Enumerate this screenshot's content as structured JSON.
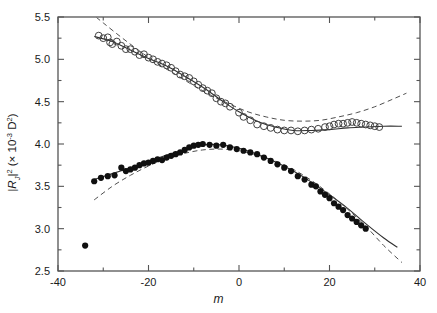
{
  "chart_data": {
    "type": "scatter",
    "title": "",
    "xlabel": "m",
    "ylabel_text": "|RJ|2 (x 10-3 D2)",
    "xlim": [
      -40,
      40
    ],
    "ylim": [
      2.5,
      5.5
    ],
    "xticks": [
      -40,
      -20,
      0,
      20,
      40
    ],
    "xtick_labels": [
      "-40",
      "-20",
      "0",
      "20",
      "40"
    ],
    "xminor_step": 10,
    "yticks": [
      2.5,
      3.0,
      3.5,
      4.0,
      4.5,
      5.0,
      5.5
    ],
    "ytick_labels": [
      "2.5",
      "3.0",
      "3.5",
      "4.0",
      "4.5",
      "5.0",
      "5.5"
    ],
    "yminor_step": 0.25,
    "grid": false,
    "legend": "none",
    "frame": "box",
    "colors": {
      "open_marker_stroke": "#404040",
      "filled_marker": "#101010",
      "fit_solid": "#303030",
      "fit_dashed": "#505050",
      "axis": "#555555",
      "background": "#ffffff"
    },
    "series": [
      {
        "name": "open-circles",
        "marker": "open-circle",
        "x": [
          -31.0,
          -30.0,
          -29.0,
          -28.5,
          -28.0,
          -27.0,
          -26.0,
          -25.0,
          -24.0,
          -23.0,
          -22.0,
          -21.0,
          -20.0,
          -19.0,
          -18.0,
          -17.0,
          -16.0,
          -15.0,
          -14.0,
          -13.0,
          -12.0,
          -11.0,
          -10.0,
          -9.0,
          -8.0,
          -7.0,
          -6.0,
          -5.0,
          -4.0,
          -3.0,
          -2.0,
          0.0,
          1.0,
          2.5,
          4.0,
          5.5,
          7.0,
          8.5,
          10.0,
          11.5,
          13.0,
          14.5,
          16.0,
          17.5,
          19.0,
          20.0,
          21.0,
          22.0,
          23.0,
          24.0,
          25.0,
          26.0,
          27.0,
          28.0,
          29.0,
          30.0,
          31.0
        ],
        "y": [
          5.28,
          5.25,
          5.26,
          5.2,
          5.18,
          5.21,
          5.16,
          5.12,
          5.12,
          5.09,
          5.05,
          5.06,
          5.02,
          5.0,
          4.97,
          4.95,
          4.93,
          4.9,
          4.86,
          4.82,
          4.8,
          4.78,
          4.74,
          4.7,
          4.66,
          4.63,
          4.6,
          4.54,
          4.5,
          4.48,
          4.44,
          4.37,
          4.32,
          4.28,
          4.23,
          4.21,
          4.19,
          4.17,
          4.16,
          4.16,
          4.15,
          4.16,
          4.17,
          4.18,
          4.2,
          4.21,
          4.23,
          4.24,
          4.24,
          4.25,
          4.26,
          4.25,
          4.24,
          4.23,
          4.22,
          4.21,
          4.2
        ]
      },
      {
        "name": "filled-circles",
        "marker": "filled-circle",
        "x": [
          -34.0,
          -32.0,
          -30.5,
          -29.0,
          -27.5,
          -26.0,
          -25.0,
          -24.0,
          -23.0,
          -22.0,
          -21.0,
          -20.0,
          -19.0,
          -18.0,
          -17.0,
          -16.0,
          -15.0,
          -14.0,
          -13.0,
          -12.0,
          -11.0,
          -10.0,
          -9.0,
          -8.0,
          -6.5,
          -5.0,
          -3.5,
          -2.0,
          -0.5,
          1.0,
          2.5,
          4.0,
          5.5,
          7.0,
          8.5,
          10.0,
          11.5,
          13.0,
          14.5,
          16.0,
          17.0,
          18.0,
          19.0,
          20.0,
          21.0,
          22.0,
          23.0,
          24.0,
          25.0,
          26.0,
          27.0,
          28.0
        ],
        "y": [
          2.8,
          3.56,
          3.6,
          3.62,
          3.63,
          3.72,
          3.68,
          3.7,
          3.72,
          3.75,
          3.77,
          3.78,
          3.8,
          3.82,
          3.81,
          3.84,
          3.86,
          3.88,
          3.9,
          3.93,
          3.96,
          3.98,
          3.99,
          4.0,
          3.99,
          3.98,
          3.99,
          3.96,
          3.94,
          3.92,
          3.9,
          3.88,
          3.84,
          3.8,
          3.76,
          3.72,
          3.68,
          3.62,
          3.58,
          3.52,
          3.5,
          3.44,
          3.4,
          3.36,
          3.3,
          3.26,
          3.22,
          3.16,
          3.12,
          3.08,
          3.04,
          3.0
        ]
      }
    ],
    "fits": [
      {
        "name": "open-solid-fit",
        "style": "solid",
        "x": [
          -32,
          -28,
          -24,
          -20,
          -16,
          -12,
          -8,
          -4,
          0,
          4,
          8,
          12,
          16,
          20,
          24,
          28,
          32,
          36
        ],
        "y": [
          5.27,
          5.21,
          5.11,
          5.01,
          4.92,
          4.8,
          4.67,
          4.52,
          4.38,
          4.27,
          4.2,
          4.16,
          4.16,
          4.17,
          4.19,
          4.2,
          4.21,
          4.21
        ]
      },
      {
        "name": "open-dashed-fit",
        "style": "dashed",
        "x": [
          -33,
          -30,
          -26,
          -22,
          -18,
          -14,
          -10,
          -6,
          -2,
          2,
          6,
          10,
          14,
          18,
          22,
          26,
          30,
          34,
          37
        ],
        "y": [
          5.56,
          5.43,
          5.26,
          5.1,
          4.95,
          4.82,
          4.69,
          4.57,
          4.47,
          4.38,
          4.32,
          4.28,
          4.27,
          4.28,
          4.32,
          4.37,
          4.44,
          4.53,
          4.6
        ]
      },
      {
        "name": "filled-solid-fit",
        "style": "solid",
        "x": [
          -32,
          -28,
          -24,
          -20,
          -16,
          -12,
          -8,
          -4,
          0,
          4,
          8,
          12,
          16,
          20,
          24,
          28,
          32,
          35
        ],
        "y": [
          3.58,
          3.65,
          3.72,
          3.79,
          3.87,
          3.93,
          3.99,
          3.99,
          3.95,
          3.88,
          3.79,
          3.68,
          3.55,
          3.4,
          3.24,
          3.06,
          2.89,
          2.78
        ]
      },
      {
        "name": "filled-dashed-fit",
        "style": "dashed",
        "x": [
          -32,
          -28,
          -24,
          -20,
          -16,
          -12,
          -8,
          -4,
          0,
          4,
          8,
          12,
          16,
          20,
          24,
          28,
          32,
          36
        ],
        "y": [
          3.34,
          3.5,
          3.63,
          3.74,
          3.83,
          3.89,
          3.93,
          3.94,
          3.92,
          3.87,
          3.8,
          3.7,
          3.57,
          3.41,
          3.23,
          3.03,
          2.8,
          2.6
        ]
      }
    ]
  },
  "axes": {
    "y_label_main": "|R",
    "y_label_sub": "J",
    "y_label_pow": "2",
    "y_label_rest": " (",
    "y_label_times": "× 10",
    "y_label_exp": "-3",
    "y_label_unit": " D",
    "y_label_unit_pow": "2",
    "y_label_close": ")",
    "x_label": "m"
  }
}
